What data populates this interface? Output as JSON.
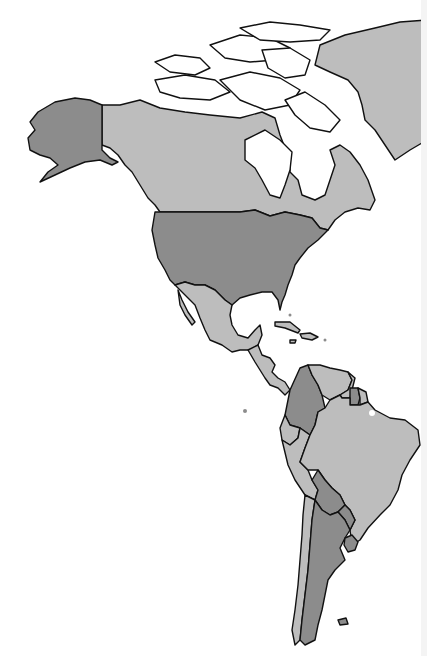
{
  "map": {
    "title": "",
    "region": "Americas",
    "colors": {
      "highlighted": "#8c8c8c",
      "default": "#bdbdbd",
      "unfilled": "#ffffff",
      "border": "#111111",
      "background": "#ffffff"
    },
    "regions": [
      {
        "name": "Alaska",
        "shade": "highlighted"
      },
      {
        "name": "Canada",
        "shade": "default"
      },
      {
        "name": "Greenland",
        "shade": "default"
      },
      {
        "name": "Arctic Archipelago",
        "shade": "unfilled"
      },
      {
        "name": "United States",
        "shade": "highlighted"
      },
      {
        "name": "Mexico",
        "shade": "default"
      },
      {
        "name": "Central America",
        "shade": "default"
      },
      {
        "name": "Caribbean",
        "shade": "default"
      },
      {
        "name": "Colombia",
        "shade": "highlighted"
      },
      {
        "name": "Venezuela",
        "shade": "default"
      },
      {
        "name": "Guyana",
        "shade": "default"
      },
      {
        "name": "Suriname",
        "shade": "highlighted"
      },
      {
        "name": "French Guiana",
        "shade": "default"
      },
      {
        "name": "Ecuador",
        "shade": "default"
      },
      {
        "name": "Peru",
        "shade": "default"
      },
      {
        "name": "Brazil",
        "shade": "default"
      },
      {
        "name": "Bolivia",
        "shade": "highlighted"
      },
      {
        "name": "Paraguay",
        "shade": "highlighted"
      },
      {
        "name": "Chile",
        "shade": "default"
      },
      {
        "name": "Argentina",
        "shade": "highlighted"
      },
      {
        "name": "Uruguay",
        "shade": "highlighted"
      }
    ]
  }
}
